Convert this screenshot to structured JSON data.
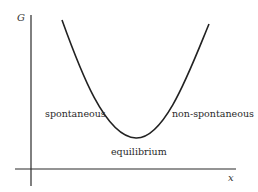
{
  "diagram": {
    "type": "gibbs-free-energy-curve",
    "axes": {
      "y_label": "G",
      "x_label": "x"
    },
    "labels": {
      "left": "spontaneous",
      "right": "non-spontaneous",
      "minimum": "equilibrium"
    },
    "colors": {
      "line": "#222222",
      "text": "#2a2a2a",
      "background": "#ffffff"
    }
  }
}
